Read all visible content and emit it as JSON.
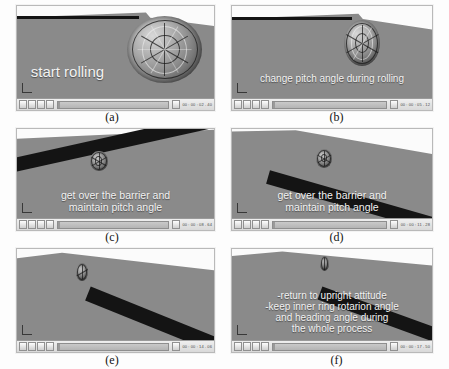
{
  "figure": {
    "panels": [
      {
        "id": "a",
        "caption": "(a)",
        "overlay_lines": [
          "start rolling"
        ],
        "player": {
          "time": "00 : 00 : 02 . 40",
          "progress_label": "02"
        },
        "scene": "spherical robot on inclined grey plane with dark barrier, robot large at right"
      },
      {
        "id": "b",
        "caption": "(b)",
        "overlay_lines": [
          "change pitch angle during rolling"
        ],
        "player": {
          "time": "00 : 00 : 05 . 12",
          "progress_label": "05"
        },
        "scene": "spherical robot mid-size on grey plane, barrier at upper left"
      },
      {
        "id": "c",
        "caption": "(c)",
        "overlay_lines": [
          "get over the barrier and",
          "maintain pitch angle"
        ],
        "player": {
          "time": "00 : 00 : 08 . 64",
          "progress_label": "08"
        },
        "scene": "robot small above diagonal dark barrier crossing the plane"
      },
      {
        "id": "d",
        "caption": "(d)",
        "overlay_lines": [
          "get over the barrier and",
          "maintain pitch  angle"
        ],
        "player": {
          "time": "00 : 00 : 11 . 28",
          "progress_label": "11"
        },
        "scene": "robot small above diagonal dark barrier, view rotated"
      },
      {
        "id": "e",
        "caption": "(e)",
        "overlay_lines": [],
        "player": {
          "time": "00 : 00 : 14 . 06",
          "progress_label": "14"
        },
        "scene": "robot small on plane with steep diagonal barrier at right"
      },
      {
        "id": "f",
        "caption": "(f)",
        "overlay_lines": [
          "-return to upright attitude",
          "-keep inner ring rotarion angle",
          "and heading angle during",
          "the whole process"
        ],
        "player": {
          "time": "00 : 00 : 17 . 50",
          "progress_label": "17"
        },
        "scene": "robot small near top, steep diagonal barrier at lower right"
      }
    ],
    "player_controls": {
      "buttons": [
        "play-button",
        "pause-button",
        "step-back-button",
        "step-forward-button"
      ],
      "stop_button": "stop-button"
    },
    "colors": {
      "ground": "#8a8a8a",
      "sky": "#fbfbfb",
      "barrier": "#141414",
      "overlay_text": "#f2f2f2",
      "panel_border": "#b9b9b9"
    }
  }
}
